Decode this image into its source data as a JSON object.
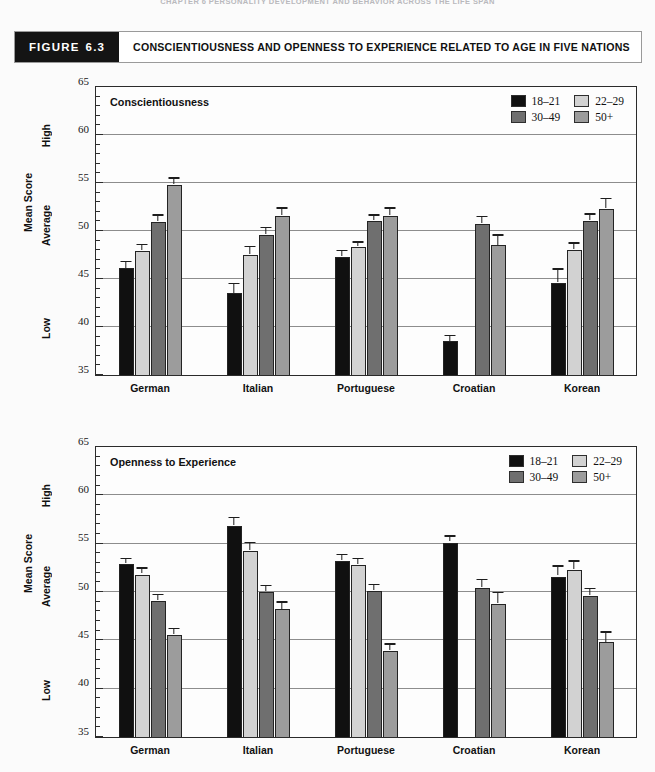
{
  "running_head": "CHAPTER 6   PERSONALITY DEVELOPMENT AND BEHAVIOR ACROSS THE LIFE SPAN",
  "caption": {
    "tag_word": "FIGURE",
    "tag_number": "6.3",
    "title": "CONSCIENTIOUSNESS AND OPENNESS TO EXPERIENCE RELATED TO AGE IN FIVE NATIONS"
  },
  "axis": {
    "y_title": "Mean Score",
    "anno_high": "High",
    "anno_average": "Average",
    "anno_low": "Low",
    "ticks": [
      "65",
      "60",
      "55",
      "50",
      "45",
      "40",
      "35"
    ]
  },
  "legend": {
    "items": [
      {
        "label": "18–21",
        "color": "#101010"
      },
      {
        "label": "22–29",
        "color": "#d2d2d2"
      },
      {
        "label": "30–49",
        "color": "#6f6f6f"
      },
      {
        "label": "50+",
        "color": "#9c9c9c"
      }
    ]
  },
  "chart_data": [
    {
      "type": "bar",
      "title": "Conscientiousness",
      "xlabel": "",
      "ylabel": "Mean Score",
      "ylim": [
        35,
        65
      ],
      "ytick_step": 5,
      "yminor_step": 1,
      "grid": true,
      "legend_position": "top-right",
      "categories": [
        "German",
        "Italian",
        "Portuguese",
        "Croatian",
        "Korean"
      ],
      "series": [
        {
          "name": "18–21",
          "color": "#101010",
          "values": [
            46.1,
            43.5,
            47.3,
            38.5,
            44.6
          ],
          "errors": [
            0.6,
            0.9,
            0.5,
            0.5,
            1.3
          ]
        },
        {
          "name": "22–29",
          "color": "#d2d2d2",
          "values": [
            47.9,
            47.5,
            48.3,
            null,
            48.0
          ],
          "errors": [
            0.5,
            0.7,
            0.4,
            null,
            0.6
          ]
        },
        {
          "name": "30–49",
          "color": "#6f6f6f",
          "values": [
            50.9,
            49.6,
            51.0,
            50.7,
            51.0
          ],
          "errors": [
            0.6,
            0.6,
            0.5,
            0.6,
            0.6
          ]
        },
        {
          "name": "50+",
          "color": "#9c9c9c",
          "values": [
            54.8,
            51.6,
            51.6,
            48.5,
            52.3
          ],
          "errors": [
            0.5,
            0.6,
            0.6,
            0.9,
            0.9
          ]
        }
      ]
    },
    {
      "type": "bar",
      "title": "Openness to Experience",
      "xlabel": "",
      "ylabel": "Mean Score",
      "ylim": [
        35,
        65
      ],
      "ytick_step": 5,
      "yminor_step": 1,
      "grid": true,
      "legend_position": "top-right",
      "categories": [
        "German",
        "Italian",
        "Portuguese",
        "Croatian",
        "Korean"
      ],
      "series": [
        {
          "name": "18–21",
          "color": "#101010",
          "values": [
            52.9,
            56.8,
            53.2,
            55.1,
            51.6
          ],
          "errors": [
            0.4,
            0.7,
            0.5,
            0.5,
            0.9
          ]
        },
        {
          "name": "22–29",
          "color": "#d2d2d2",
          "values": [
            51.8,
            54.2,
            52.8,
            null,
            52.3
          ],
          "errors": [
            0.5,
            0.7,
            0.5,
            null,
            0.7
          ]
        },
        {
          "name": "30–49",
          "color": "#6f6f6f",
          "values": [
            49.1,
            50.0,
            50.1,
            50.4,
            49.6
          ],
          "errors": [
            0.5,
            0.5,
            0.5,
            0.7,
            0.6
          ]
        },
        {
          "name": "50+",
          "color": "#9c9c9c",
          "values": [
            45.6,
            48.2,
            43.9,
            48.8,
            44.8
          ],
          "errors": [
            0.5,
            0.6,
            0.6,
            1.0,
            0.9
          ]
        }
      ]
    }
  ]
}
